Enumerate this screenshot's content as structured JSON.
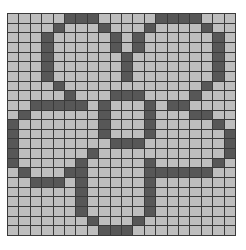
{
  "board": {
    "cols": 20,
    "rows": 23,
    "colors": {
      "empty": "#bebebe",
      "filled": "#575757",
      "grid_line": "#3a3a3a",
      "background": "#ffffff"
    },
    "filled_cells": [
      [
        5,
        6,
        7,
        13,
        14,
        15,
        16
      ],
      [
        4,
        8,
        12,
        17
      ],
      [
        3,
        9,
        11,
        18
      ],
      [
        3,
        9,
        11,
        18
      ],
      [
        3,
        10,
        18
      ],
      [
        3,
        10,
        18
      ],
      [
        3,
        10,
        18
      ],
      [
        4,
        17
      ],
      [
        5,
        9,
        10,
        11,
        16
      ],
      [
        2,
        3,
        4,
        5,
        6,
        8,
        12,
        14,
        15
      ],
      [
        1,
        8,
        12,
        16,
        17
      ],
      [
        0,
        8,
        12,
        18
      ],
      [
        0,
        8,
        12,
        19
      ],
      [
        0,
        9,
        10,
        11,
        19
      ],
      [
        0,
        7,
        19
      ],
      [
        0,
        6,
        12,
        18
      ],
      [
        1,
        5,
        6,
        12,
        13,
        14,
        15,
        16,
        17
      ],
      [
        2,
        3,
        4,
        6,
        12
      ],
      [
        6,
        12
      ],
      [
        6,
        12
      ],
      [
        6,
        12
      ],
      [
        7,
        11
      ],
      [
        8,
        9,
        10
      ]
    ]
  }
}
